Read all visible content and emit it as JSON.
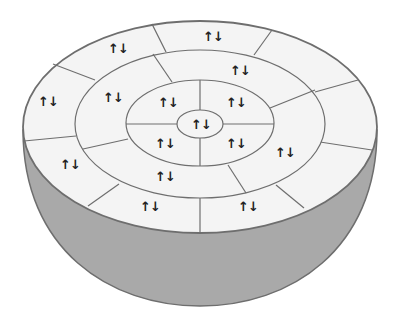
{
  "figure": {
    "colors": {
      "background": "#ffffff",
      "top_surface": "#f4f4f4",
      "bowl_fill": "#a9a9a9",
      "outline": "#6e6e6e",
      "arrow": "#222222"
    },
    "shells": [
      {
        "name": "core",
        "cells": 1
      },
      {
        "name": "inner-ring",
        "cells": 4
      },
      {
        "name": "middle-ring",
        "cells": 4
      },
      {
        "name": "outer-ring",
        "cells": 9
      }
    ],
    "spin_symbol": "↑↓",
    "labels": [
      {
        "shell": "core",
        "x": 201,
        "y": 124,
        "text": "↑↓"
      },
      {
        "shell": "inner-ring",
        "x": 168,
        "y": 102,
        "text": "↑↓"
      },
      {
        "shell": "inner-ring",
        "x": 236,
        "y": 102,
        "text": "↑↓"
      },
      {
        "shell": "inner-ring",
        "x": 165,
        "y": 143,
        "text": "↑↓"
      },
      {
        "shell": "inner-ring",
        "x": 236,
        "y": 143,
        "text": "↑↓"
      },
      {
        "shell": "middle-ring",
        "x": 113,
        "y": 97,
        "text": "↑↓"
      },
      {
        "shell": "middle-ring",
        "x": 240,
        "y": 70,
        "text": "↑↓"
      },
      {
        "shell": "middle-ring",
        "x": 285,
        "y": 152,
        "text": "↑↓"
      },
      {
        "shell": "middle-ring",
        "x": 165,
        "y": 176,
        "text": "↑↓"
      },
      {
        "shell": "outer-ring",
        "x": 118,
        "y": 48,
        "text": "↑↓"
      },
      {
        "shell": "outer-ring",
        "x": 213,
        "y": 36,
        "text": "↑↓"
      },
      {
        "shell": "outer-ring",
        "x": 48,
        "y": 101,
        "text": "↑↓"
      },
      {
        "shell": "outer-ring",
        "x": 70,
        "y": 164,
        "text": "↑↓"
      },
      {
        "shell": "outer-ring",
        "x": 150,
        "y": 206,
        "text": "↑↓"
      },
      {
        "shell": "outer-ring",
        "x": 248,
        "y": 206,
        "text": "↑↓"
      }
    ]
  }
}
